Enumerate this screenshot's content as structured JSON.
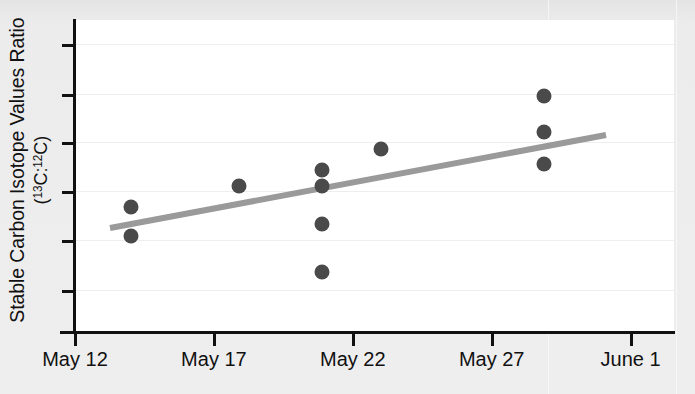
{
  "chart_data": {
    "type": "scatter",
    "title": "",
    "xlabel": "",
    "ylabel": "Stable Carbon Isotope Values Ratio (13C:12C)",
    "ylabel_line1": "Stable Carbon Isotope Values Ratio",
    "ylabel_line2_prefix": "(",
    "ylabel_line2_sup1": "13",
    "ylabel_line2_mid": "C:",
    "ylabel_line2_sup2": "12",
    "ylabel_line2_suffix": "C)",
    "x_tick_labels": [
      "May 12",
      "May 17",
      "May 22",
      "May 27",
      "June 1"
    ],
    "x_tick_days": [
      0,
      5,
      10,
      15,
      20
    ],
    "x_axis_start_label": "May 12",
    "x_axis_end_label": "June 1",
    "xlim_days": [
      -0.6,
      21.2
    ],
    "y_axis_labeled": false,
    "y_tick_count": 6,
    "ylim": [
      0,
      1
    ],
    "grid": true,
    "grid_orientation": "horizontal",
    "point_color": "#4a4a4a",
    "trendline_color": "#9a9a9a",
    "background_color": "#ffffff",
    "page_background_color": "#eeeeee",
    "axis_color": "#111111",
    "points": [
      {
        "date": "May 14",
        "day": 2.0,
        "y_px": 207
      },
      {
        "date": "May 14",
        "day": 2.0,
        "y_px": 236
      },
      {
        "date": "May 18",
        "day": 5.9,
        "y_px": 186
      },
      {
        "date": "May 21",
        "day": 8.9,
        "y_px": 170
      },
      {
        "date": "May 21",
        "day": 8.9,
        "y_px": 186
      },
      {
        "date": "May 21",
        "day": 8.9,
        "y_px": 224
      },
      {
        "date": "May 21",
        "day": 8.9,
        "y_px": 272
      },
      {
        "date": "May 23",
        "day": 11.0,
        "y_px": 149
      },
      {
        "date": "May 28",
        "day": 16.9,
        "y_px": 96
      },
      {
        "date": "May 28",
        "day": 16.9,
        "y_px": 132
      },
      {
        "date": "May 28",
        "day": 16.9,
        "y_px": 164
      }
    ],
    "trendline": {
      "x_start_px": 110,
      "y_start_px": 228,
      "x_end_px": 606,
      "y_end_px": 135,
      "description": "increasing linear fit"
    },
    "ytick_positions_px": [
      44,
      94,
      142,
      191,
      240,
      290
    ],
    "gridline_positions_px": [
      44,
      94,
      142,
      191,
      240,
      290
    ],
    "annotations": []
  }
}
